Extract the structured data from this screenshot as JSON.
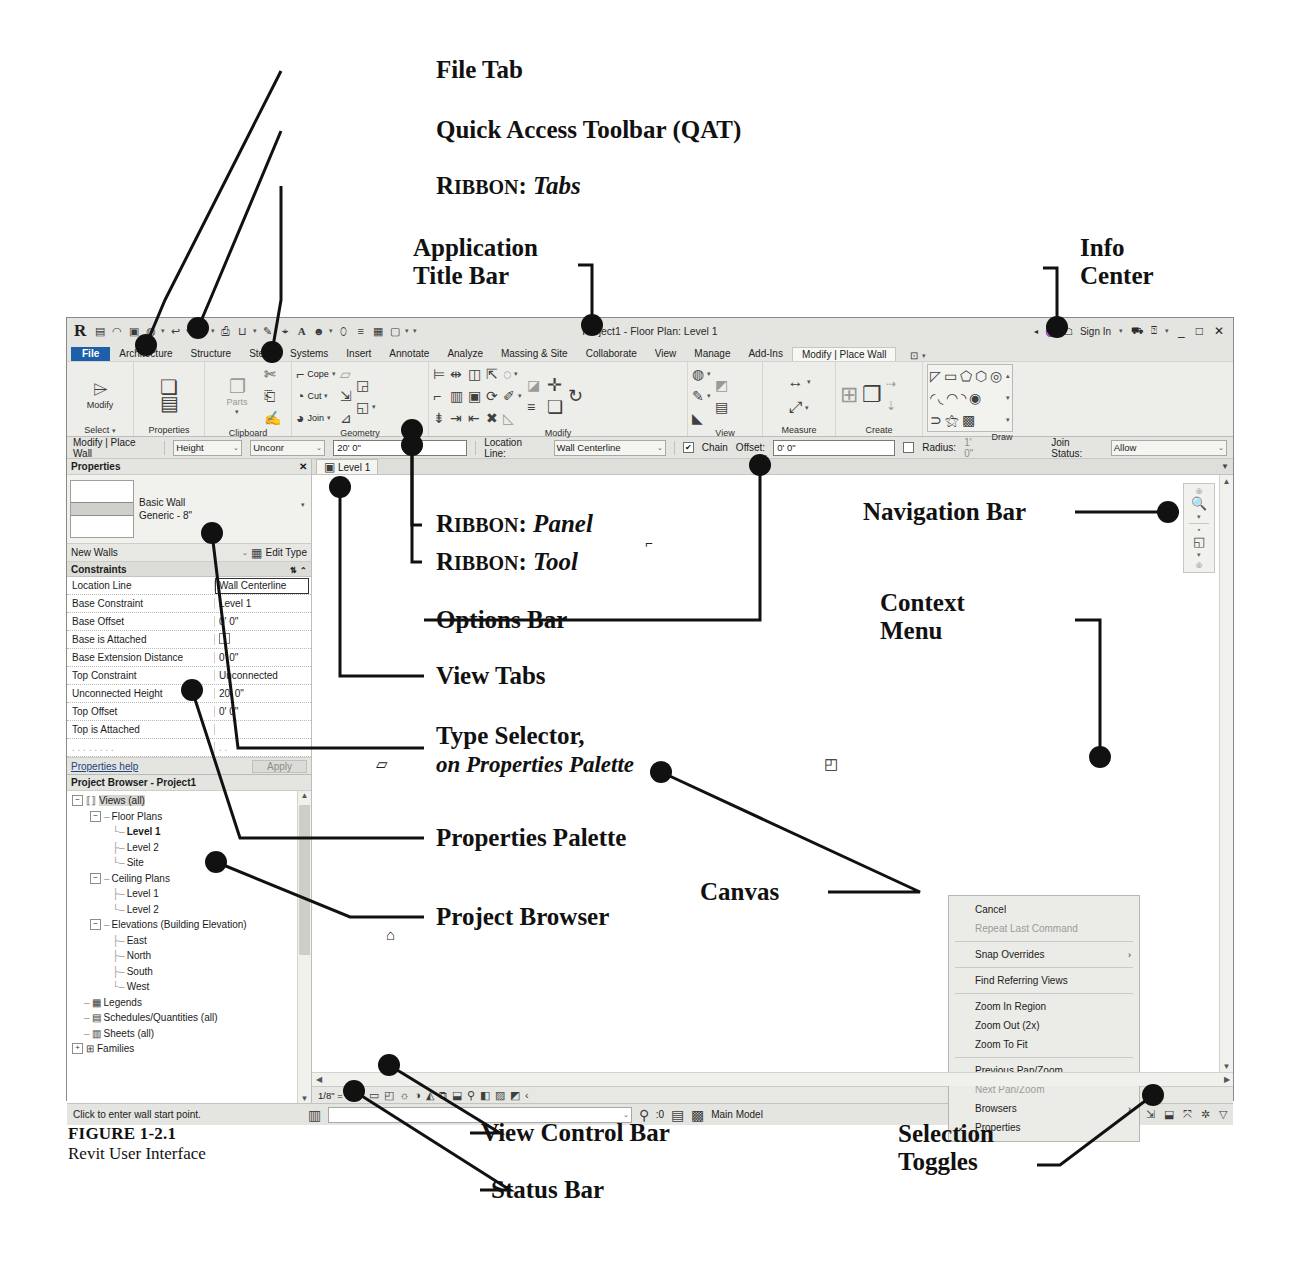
{
  "figure": {
    "number": "FIGURE 1-2.1",
    "caption": "Revit User Interface"
  },
  "annotations": {
    "file_tab": "File Tab",
    "qat": "Quick Access Toolbar (QAT)",
    "ribbon_tabs_pre": "Ribbon:",
    "ribbon_tabs_em": "Tabs",
    "app_title_bar_l1": "Application",
    "app_title_bar_l2": "Title Bar",
    "info_center_l1": "Info",
    "info_center_l2": "Center",
    "ribbon_panel_pre": "Ribbon:",
    "ribbon_panel_em": "Panel",
    "ribbon_tool_pre": "Ribbon:",
    "ribbon_tool_em": "Tool",
    "options_bar": "Options Bar",
    "view_tabs": "View Tabs",
    "type_selector_l1": "Type Selector,",
    "type_selector_l2": "on Properties Palette",
    "properties_palette": "Properties Palette",
    "project_browser": "Project Browser",
    "navigation_bar": "Navigation Bar",
    "context_menu_l1": "Context",
    "context_menu_l2": "Menu",
    "canvas": "Canvas",
    "view_control_bar": "View Control Bar",
    "status_bar": "Status Bar",
    "selection_toggles_l1": "Selection",
    "selection_toggles_l2": "Toggles"
  },
  "app": {
    "logo": "R",
    "title": "Project1 - Floor Plan: Level 1",
    "qat_icons": [
      "sheet-icon",
      "open-icon",
      "save-icon",
      "save-as-icon",
      "undo-icon",
      "redo-icon",
      "print-icon",
      "sync-icon",
      "measure-icon",
      "aligned-dimension-icon",
      "tag-icon",
      "text-icon",
      "default-3d-view-icon",
      "section-icon",
      "thin-lines-icon",
      "close-hidden-icon",
      "switch-window-icon",
      "customize-qat-icon"
    ],
    "info_center": {
      "search_icon": "binoculars-icon",
      "sign_in": "Sign In",
      "store_icon": "cart-icon",
      "help_icon": "help-icon"
    },
    "window_buttons": {
      "minimize": "_",
      "maximize": "□",
      "close": "✕"
    }
  },
  "ribbon": {
    "tabs": [
      "File",
      "Architecture",
      "Structure",
      "Steel",
      "Systems",
      "Insert",
      "Annotate",
      "Analyze",
      "Massing & Site",
      "Collaborate",
      "View",
      "Manage",
      "Add-Ins"
    ],
    "context_tab": "Modify | Place Wall",
    "panels": [
      {
        "name": "Select",
        "big_tool": {
          "label": "Modify",
          "icon": "arrow-cursor-icon"
        }
      },
      {
        "name": "Properties",
        "tools": [
          "type-properties-icon",
          "properties-panel-icon"
        ]
      },
      {
        "name": "Clipboard",
        "tools": [
          "paste-icon",
          "cut-icon",
          "copy-icon",
          "match-type-icon"
        ],
        "label": "Parts"
      },
      {
        "name": "Geometry",
        "tools": [
          "cope-icon",
          "cut-icon",
          "join-icon",
          "demolish-icon",
          "split-face-icon",
          "paint-icon"
        ],
        "labels": [
          "Cope",
          "Cut",
          "Join"
        ]
      },
      {
        "name": "Modify",
        "tools": [
          "align-icon",
          "offset-icon",
          "mirror-axis-icon",
          "mirror-pick-icon",
          "move-icon",
          "copy-icon",
          "rotate-icon",
          "trim-extend-icon",
          "split-icon",
          "array-icon",
          "scale-icon",
          "pin-icon",
          "delete-icon"
        ]
      },
      {
        "name": "View",
        "tools": [
          "cut-profile-icon",
          "hide-icon",
          "show-hidden-icon"
        ]
      },
      {
        "name": "Measure",
        "tools": [
          "measure-between-icon",
          "measure-along-icon"
        ]
      },
      {
        "name": "Create",
        "tools": [
          "create-similar-icon",
          "create-group-icon"
        ]
      },
      {
        "name": "Draw",
        "tools": [
          "line-icon",
          "rectangle-icon",
          "polygon-inscribed-icon",
          "polygon-circumscribed-icon",
          "circle-icon",
          "arc-3-point-icon",
          "arc-center-ends-icon",
          "arc-tangent-icon",
          "fillet-arc-icon",
          "ellipse-icon",
          "spline-icon",
          "pick-lines-icon",
          "pick-faces-icon"
        ]
      }
    ]
  },
  "options_bar": {
    "context": "Modify | Place Wall",
    "height_label": "Height",
    "level_value": "Unconr",
    "height_value": "20' 0\"",
    "location_line_label": "Location Line:",
    "location_line_value": "Wall Centerline",
    "chain_label": "Chain",
    "chain_checked": true,
    "offset_label": "Offset:",
    "offset_value": "0' 0\"",
    "radius_label": "Radius:",
    "radius_value": "1' 0\"",
    "radius_checked": false,
    "join_status_label": "Join Status:",
    "join_status_value": "Allow"
  },
  "properties": {
    "title": "Properties",
    "close_icon": "close-icon",
    "type_family": "Basic Wall",
    "type_name": "Generic - 8\"",
    "scope": "New Walls",
    "edit_type": "Edit Type",
    "group": "Constraints",
    "rows": [
      {
        "key": "Location Line",
        "value": "Wall Centerline",
        "selected": true
      },
      {
        "key": "Base Constraint",
        "value": "Level 1"
      },
      {
        "key": "Base Offset",
        "value": "0' 0\""
      },
      {
        "key": "Base is Attached",
        "value": "",
        "checkbox": true
      },
      {
        "key": "Base Extension Distance",
        "value": "0' 0\""
      },
      {
        "key": "Top Constraint",
        "value": "Unconnected"
      },
      {
        "key": "Unconnected Height",
        "value": "20' 0\""
      },
      {
        "key": "Top Offset",
        "value": "0' 0\""
      },
      {
        "key": "Top is Attached",
        "value": ""
      }
    ],
    "help_link": "Properties help",
    "apply_button": "Apply"
  },
  "project_browser": {
    "title": "Project Browser - Project1",
    "nodes": [
      {
        "label": "Views (all)",
        "depth": 0,
        "expander": "-",
        "icon": "views-icon",
        "highlight": true
      },
      {
        "label": "Floor Plans",
        "depth": 1,
        "expander": "-",
        "icon": ""
      },
      {
        "label": "Level 1",
        "depth": 2,
        "bold": true
      },
      {
        "label": "Level 2",
        "depth": 2
      },
      {
        "label": "Site",
        "depth": 2
      },
      {
        "label": "Ceiling Plans",
        "depth": 1,
        "expander": "-"
      },
      {
        "label": "Level 1",
        "depth": 2
      },
      {
        "label": "Level 2",
        "depth": 2
      },
      {
        "label": "Elevations (Building Elevation)",
        "depth": 1,
        "expander": "-"
      },
      {
        "label": "East",
        "depth": 2
      },
      {
        "label": "North",
        "depth": 2
      },
      {
        "label": "South",
        "depth": 2
      },
      {
        "label": "West",
        "depth": 2
      },
      {
        "label": "Legends",
        "depth": 0,
        "icon": "legend-icon"
      },
      {
        "label": "Schedules/Quantities (all)",
        "depth": 0,
        "icon": "schedule-icon"
      },
      {
        "label": "Sheets (all)",
        "depth": 0,
        "icon": "sheet-icon"
      },
      {
        "label": "Families",
        "depth": 0,
        "expander": "+",
        "icon": "family-icon"
      }
    ]
  },
  "view_tab": {
    "label": "Level 1",
    "icon": "floor-plan-icon"
  },
  "context_menu": {
    "items": [
      {
        "label": "Cancel"
      },
      {
        "label": "Repeat Last Command",
        "disabled": true
      },
      {
        "sep": true
      },
      {
        "label": "Snap Overrides",
        "submenu": true
      },
      {
        "sep": true
      },
      {
        "label": "Find Referring Views"
      },
      {
        "sep": true
      },
      {
        "label": "Zoom In Region"
      },
      {
        "label": "Zoom Out (2x)"
      },
      {
        "label": "Zoom To Fit"
      },
      {
        "sep": true
      },
      {
        "label": "Previous Pan/Zoom"
      },
      {
        "label": "Next Pan/Zoom",
        "disabled": true
      },
      {
        "label": "Browsers",
        "submenu": true
      },
      {
        "label": "Properties",
        "checked": true
      }
    ]
  },
  "navigation_bar": {
    "icons": [
      "steering-wheel-icon",
      "zoom-icon",
      "orbit-2d-icon"
    ]
  },
  "view_control_bar": {
    "scale": "1/8\" = 1'-0\"",
    "icons": [
      "detail-level-coarse-icon",
      "visual-style-icon",
      "sun-path-icon",
      "shadows-off-icon",
      "render-dialog-icon",
      "crop-view-icon",
      "show-crop-icon",
      "temp-hide-isolate-icon",
      "reveal-hidden-icon",
      "analytical-model-icon",
      "constraints-icon",
      "expand-icon"
    ]
  },
  "status_bar": {
    "message": "Click to enter wall start point.",
    "filter_count": ":0",
    "workset": "Main Model",
    "selection_toggles": [
      "select-links-icon",
      "select-underlay-icon",
      "select-pinned-icon",
      "select-by-face-icon",
      "drag-on-hover-icon",
      "active-workset-icon",
      "filter-icon"
    ]
  }
}
